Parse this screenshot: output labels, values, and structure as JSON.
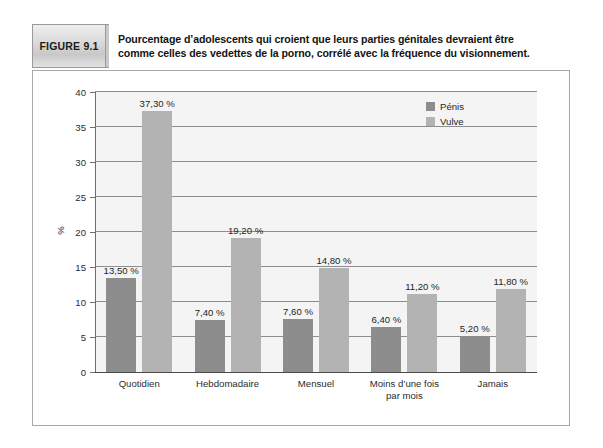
{
  "figure": {
    "badge_label": "FIGURE  9.1",
    "title_line_1": "Pourcentage d’adolescents qui croient que leurs parties génitales devraient être",
    "title_line_2": "comme celles des vedettes de la porno, corrélé avec la fréquence du visionnement."
  },
  "colors": {
    "series_penis": "#8d8d8d",
    "series_vulve": "#b3b3b3",
    "plot_background": "#f4f4f4",
    "gridline": "#8d8d8d",
    "axis": "#4a4a4a",
    "frame_border": "#a8a8a8"
  },
  "chart_data": {
    "type": "bar",
    "title": "Pourcentage d’adolescents qui croient que leurs parties génitales devraient être comme celles des vedettes de la porno, corrélé avec la fréquence du visionnement.",
    "xlabel": "",
    "ylabel": "%",
    "ylim": [
      0,
      40
    ],
    "yticks": [
      0,
      5,
      10,
      15,
      20,
      25,
      30,
      35,
      40
    ],
    "ytick_labels": [
      "0",
      "5",
      "10",
      "15",
      "20",
      "25",
      "30",
      "35",
      "40"
    ],
    "grid": true,
    "legend_position": "top-right",
    "categories": [
      "Quotidien",
      "Hebdomadaire",
      "Mensuel",
      "Moins d’une fois\npar mois",
      "Jamais"
    ],
    "category_lines": [
      [
        "Quotidien"
      ],
      [
        "Hebdomadaire"
      ],
      [
        "Mensuel"
      ],
      [
        "Moins d’une fois",
        "par mois"
      ],
      [
        "Jamais"
      ]
    ],
    "series": [
      {
        "name": "Pénis",
        "color": "#8d8d8d",
        "values": [
          13.5,
          7.4,
          7.6,
          6.4,
          5.2
        ],
        "labels": [
          "13,50 %",
          "7,40 %",
          "7,60 %",
          "6,40 %",
          "5,20 %"
        ]
      },
      {
        "name": "Vulve",
        "color": "#b3b3b3",
        "values": [
          37.3,
          19.2,
          14.8,
          11.2,
          11.8
        ],
        "labels": [
          "37,30 %",
          "19,20 %",
          "14,80 %",
          "11,20 %",
          "11,80 %"
        ]
      }
    ]
  }
}
